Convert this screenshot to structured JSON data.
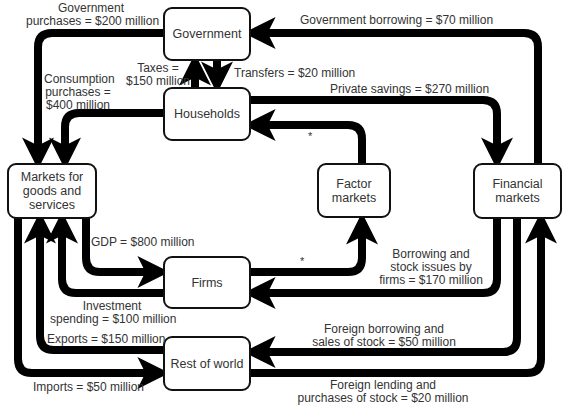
{
  "diagram": {
    "title_cutoff": "",
    "nodes": {
      "government": "Government",
      "households": "Households",
      "markets": "Markets for goods and services",
      "factor": "Factor markets",
      "financial": "Financial markets",
      "firms": "Firms",
      "rest_of_world": "Rest of world"
    },
    "flows": {
      "gov_purchases_1": "Government",
      "gov_purchases_2": "purchases = $200 million",
      "gov_borrowing": "Government borrowing = $70 million",
      "taxes_1": "Taxes =",
      "taxes_2": "$150 million",
      "transfers": "Transfers = $20 million",
      "consumption_1": "Consumption",
      "consumption_2": "purchases =",
      "consumption_3": "$400 million",
      "private_savings": "Private savings = $270 million",
      "gdp": "GDP = $800 million",
      "borrowing_firms_1": "Borrowing and",
      "borrowing_firms_2": "stock issues by",
      "borrowing_firms_3": "firms = $170 million",
      "investment_1": "Investment",
      "investment_2": "spending = $100 million",
      "exports": "Exports = $150 million",
      "foreign_borrowing_1": "Foreign borrowing and",
      "foreign_borrowing_2": "sales of stock = $50 million",
      "imports": "Imports = $50 million",
      "foreign_lending_1": "Foreign lending and",
      "foreign_lending_2": "purchases of stock = $20 million"
    },
    "markers": {
      "asterisk": "*"
    },
    "colors": {
      "line": "#000000",
      "text": "#333333",
      "background": "#ffffff"
    }
  }
}
